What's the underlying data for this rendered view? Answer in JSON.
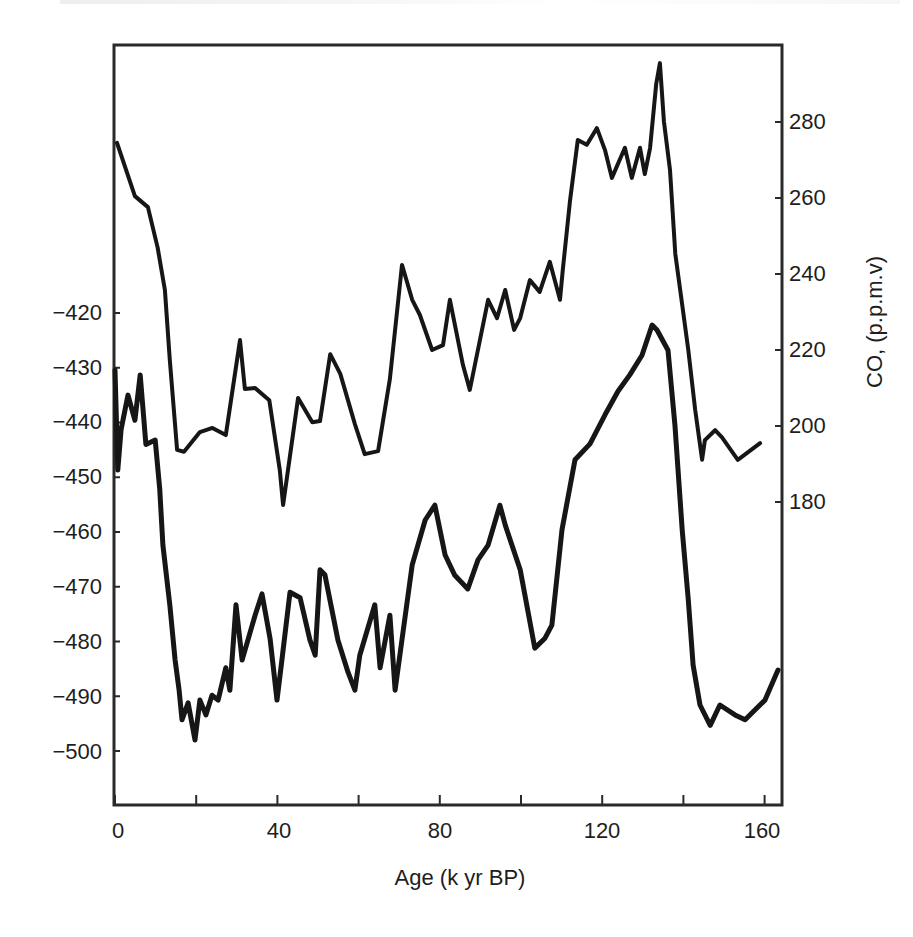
{
  "chart_data": {
    "type": "line",
    "title": "",
    "xlabel": "Age (k yr BP)",
    "ylabel_left": "",
    "ylabel_right": "CO, (p.p.m.v)",
    "xlim": [
      0,
      164
    ],
    "ylim_left": [
      -512,
      -400
    ],
    "ylim_right": [
      167,
      300
    ],
    "x_ticks": [
      0,
      40,
      80,
      120,
      160
    ],
    "x_minor_ticks": [
      20,
      60,
      100,
      140
    ],
    "y_left_ticks": [
      -420,
      -430,
      -440,
      -450,
      -460,
      -470,
      -480,
      -490,
      -500
    ],
    "y_left_tick_labels": [
      "−420",
      "−430",
      "−440",
      "−450",
      "−460",
      "−470",
      "−480",
      "−490",
      "−500"
    ],
    "y_right_ticks": [
      280,
      260,
      240,
      220,
      200,
      180
    ],
    "grid": false,
    "legend": null,
    "series": [
      {
        "name": "CO2 (upper curve)",
        "axis": "right",
        "x": [
          0.5,
          4.9,
          8.1,
          10.5,
          12.3,
          13.5,
          15.3,
          17.0,
          20.9,
          24.0,
          27.3,
          30.8,
          32.0,
          34.5,
          38.0,
          40.6,
          41.4,
          45.1,
          48.6,
          50.5,
          53.0,
          55.5,
          59.1,
          61.5,
          64.8,
          67.7,
          70.7,
          73.2,
          75.1,
          78.1,
          80.8,
          82.5,
          85.7,
          87.4,
          91.9,
          94.1,
          96.1,
          98.3,
          99.8,
          102.2,
          104.6,
          107.1,
          109.6,
          110.3,
          112.1,
          114.0,
          116.2,
          118.7,
          120.7,
          122.4,
          125.6,
          127.3,
          129.3,
          130.5,
          131.8,
          133.3,
          134.2,
          135.2,
          136.7,
          138.0,
          139.2,
          141.2,
          142.9,
          144.6,
          145.3,
          147.8,
          149.5,
          153.4,
          158.9
        ],
        "values": [
          274.5,
          260.5,
          257.6,
          247.0,
          235.8,
          217.4,
          193.7,
          193.2,
          198.4,
          199.5,
          197.6,
          222.6,
          209.7,
          210.0,
          206.8,
          188.4,
          179.2,
          207.4,
          201.0,
          201.3,
          218.9,
          213.7,
          200.5,
          192.6,
          193.4,
          212.4,
          242.4,
          233.2,
          229.2,
          220.0,
          221.3,
          233.2,
          216.1,
          209.5,
          233.2,
          228.4,
          235.8,
          225.3,
          228.4,
          238.4,
          235.3,
          243.2,
          233.2,
          241.1,
          259.5,
          275.3,
          274.0,
          278.4,
          272.6,
          265.3,
          273.2,
          265.3,
          273.2,
          266.3,
          273.2,
          290.0,
          295.5,
          280.2,
          267.4,
          245.3,
          235.8,
          220.0,
          204.2,
          191.1,
          196.3,
          198.9,
          197.0,
          191.1,
          195.5
        ]
      },
      {
        "name": "Deuterium (lower curve)",
        "axis": "left",
        "x": [
          0.0,
          0.7,
          1.5,
          3.2,
          4.9,
          6.2,
          7.6,
          9.9,
          11.0,
          11.8,
          13.5,
          14.8,
          15.8,
          16.5,
          18.0,
          19.7,
          20.9,
          22.4,
          23.9,
          25.4,
          27.3,
          28.3,
          29.8,
          31.3,
          34.5,
          36.2,
          38.2,
          39.9,
          41.1,
          43.1,
          45.6,
          48.0,
          49.3,
          50.5,
          51.7,
          54.9,
          57.4,
          59.1,
          60.3,
          64.0,
          65.3,
          67.7,
          69.0,
          71.0,
          73.2,
          76.4,
          78.8,
          81.3,
          83.7,
          86.9,
          89.4,
          91.9,
          94.8,
          96.1,
          99.8,
          103.4,
          105.9,
          107.6,
          110.1,
          113.3,
          117.0,
          120.7,
          123.9,
          126.8,
          129.8,
          132.3,
          133.5,
          136.2,
          137.9,
          139.7,
          141.2,
          142.4,
          144.1,
          146.6,
          149.0,
          152.7,
          155.2,
          157.6,
          160.1,
          163.3
        ],
        "values": [
          -430.4,
          -448.7,
          -441.3,
          -435.0,
          -439.6,
          -431.3,
          -444.0,
          -443.2,
          -452.1,
          -462.4,
          -473.3,
          -483.4,
          -488.9,
          -494.3,
          -491.2,
          -498.0,
          -490.7,
          -493.4,
          -489.8,
          -490.7,
          -484.8,
          -488.9,
          -473.3,
          -483.4,
          -475.2,
          -471.3,
          -479.5,
          -490.7,
          -483.4,
          -471.0,
          -472.0,
          -479.7,
          -482.5,
          -466.9,
          -467.8,
          -479.7,
          -485.6,
          -488.9,
          -482.5,
          -473.3,
          -484.8,
          -475.2,
          -488.9,
          -477.9,
          -466.0,
          -457.8,
          -455.1,
          -464.2,
          -467.9,
          -470.4,
          -465.1,
          -462.4,
          -455.1,
          -458.7,
          -466.9,
          -481.2,
          -479.4,
          -477.0,
          -459.6,
          -446.8,
          -443.9,
          -438.6,
          -434.3,
          -431.3,
          -427.7,
          -422.2,
          -423.1,
          -426.8,
          -440.4,
          -459.6,
          -472.4,
          -484.3,
          -491.6,
          -495.3,
          -491.6,
          -493.4,
          -494.3,
          -492.5,
          -490.7,
          -485.2
        ]
      }
    ]
  },
  "axes": {
    "x_tick_labels": [
      "0",
      "40",
      "80",
      "120",
      "160"
    ],
    "x_title": "Age (k yr BP)",
    "y_left_tick_labels": [
      "−420",
      "−430",
      "−440",
      "−450",
      "−460",
      "−470",
      "−480",
      "−490",
      "−500"
    ],
    "y_right_tick_labels": [
      "280",
      "260",
      "240",
      "220",
      "200",
      "180"
    ],
    "y_right_title": "CO, (p.p.m.v)"
  },
  "style": {
    "line_color": "#161616",
    "frame_color": "#2a2a2a",
    "background": "#ffffff"
  }
}
